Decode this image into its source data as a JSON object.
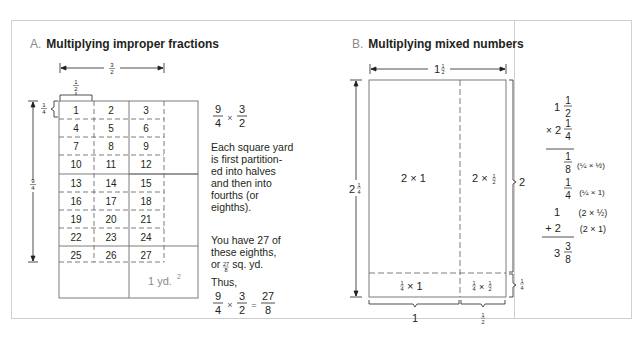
{
  "panel_a": {
    "letter": "A.",
    "title": "Multiplying improper fractions",
    "top_dimension": "3/2",
    "top_brace": "1/2",
    "left_brace": "1/4",
    "left_dimension": "9/4",
    "cells": [
      "1",
      "2",
      "3",
      "4",
      "5",
      "6",
      "7",
      "8",
      "9",
      "10",
      "11",
      "12",
      "13",
      "14",
      "15",
      "16",
      "17",
      "18",
      "19",
      "20",
      "21",
      "22",
      "23",
      "24",
      "25",
      "26",
      "27"
    ],
    "unit_label": "1 yd.",
    "unit_exponent": "2",
    "expression": {
      "a_num": "9",
      "a_den": "4",
      "op": "×",
      "b_num": "3",
      "b_den": "2"
    },
    "paragraph_1": "Each square yard is first partition-ed into halves and then into fourths (or eighths).",
    "paragraph_1_lines": [
      "Each square yard",
      "is first partition-",
      "ed into halves",
      "and then into",
      "fourths (or",
      "eighths)."
    ],
    "paragraph_2_lines": [
      "You have 27 of",
      "these eighths,",
      "or",
      "sq. yd."
    ],
    "paragraph_2_fraction": {
      "num": "27",
      "den": "8"
    },
    "thus": "Thus,",
    "result": {
      "a_num": "9",
      "a_den": "4",
      "op": "×",
      "b_num": "3",
      "b_den": "2",
      "eq": "=",
      "r_num": "27",
      "r_den": "8"
    }
  },
  "panel_b": {
    "letter": "B.",
    "title": "Multiplying mixed numbers",
    "top_dimension": {
      "whole": "1",
      "num": "1",
      "den": "2"
    },
    "left_dimension": {
      "whole": "2",
      "num": "1",
      "den": "4"
    },
    "right_brace_big": "2",
    "right_brace_small": "1/4",
    "bottom_brace_left": "1",
    "bottom_brace_right": "1/2",
    "regions": [
      "2 × 1",
      "2 × 1/2",
      "1/4 × 1",
      "1/4 × 1/2"
    ],
    "computation": {
      "m1": {
        "whole": "1",
        "num": "1",
        "den": "2"
      },
      "m2": {
        "op": "×",
        "whole": "2",
        "num": "1",
        "den": "4"
      },
      "partials": [
        {
          "value": "1/8",
          "note": "(1/4 × 1/2)"
        },
        {
          "value": "1/4",
          "note": "(1/4 × 1)"
        },
        {
          "value": "1",
          "note": "(2 × 1/2)"
        },
        {
          "value": "+ 2",
          "note": "(2 × 1)"
        }
      ],
      "result": {
        "whole": "3",
        "num": "3",
        "den": "8"
      }
    }
  },
  "colors": {
    "text": "#231f20",
    "border": "#c8c8c8",
    "grid": "#6d6d6d",
    "muted": "#8a8a8a"
  }
}
